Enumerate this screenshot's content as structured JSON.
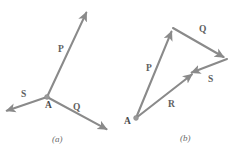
{
  "figure": {
    "background_color": "#ffffff",
    "stroke_color": "#8a8a8a",
    "label_color": "#5e5e5e",
    "panels": [
      {
        "id": "a",
        "caption": "(a)",
        "caption_x": 52,
        "caption_y": 142,
        "origin_label": "A",
        "origin_label_x": 45,
        "origin_label_y": 108,
        "origin_x": 47,
        "origin_y": 97,
        "vectors": [
          {
            "name": "P",
            "label": "P",
            "label_x": 58,
            "label_y": 52,
            "x1": 47,
            "y1": 97,
            "x2": 88,
            "y2": 9
          },
          {
            "name": "S",
            "label": "S",
            "label_x": 21,
            "label_y": 97,
            "x1": 47,
            "y1": 97,
            "x2": 3,
            "y2": 112
          },
          {
            "name": "Q",
            "label": "Q",
            "label_x": 73,
            "label_y": 110,
            "x1": 47,
            "y1": 97,
            "x2": 110,
            "y2": 131
          }
        ]
      },
      {
        "id": "b",
        "caption": "(b)",
        "caption_x": 180,
        "caption_y": 141,
        "origin_label": "A",
        "origin_label_x": 124,
        "origin_label_y": 124,
        "origin_x": 136,
        "origin_y": 118,
        "vectors": [
          {
            "name": "P",
            "label": "P",
            "label_x": 146,
            "label_y": 71,
            "x1": 136,
            "y1": 118,
            "x2": 173,
            "y2": 28
          },
          {
            "name": "Q",
            "label": "Q",
            "label_x": 199,
            "label_y": 32,
            "x1": 173,
            "y1": 28,
            "x2": 227,
            "y2": 59
          },
          {
            "name": "S",
            "label": "S",
            "label_x": 208,
            "label_y": 82,
            "x1": 227,
            "y1": 59,
            "x2": 188,
            "y2": 74
          },
          {
            "name": "R",
            "label": "R",
            "label_x": 168,
            "label_y": 107,
            "x1": 136,
            "y1": 118,
            "x2": 195,
            "y2": 72
          }
        ]
      }
    ]
  }
}
